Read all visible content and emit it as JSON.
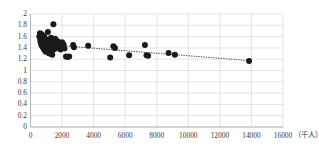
{
  "chart_data": {
    "type": "scatter",
    "title": "",
    "subtitle": "",
    "xlabel": "",
    "ylabel": "",
    "x_unit_label": "（千人）",
    "xlim": [
      0,
      16000
    ],
    "ylim": [
      0,
      2
    ],
    "xticks": [
      0,
      2000,
      4000,
      6000,
      8000,
      10000,
      12000,
      14000,
      16000
    ],
    "xtick_labels": [
      "0",
      "2000",
      "4000",
      "6000",
      "8000",
      "10000",
      "12000",
      "14000",
      "16000"
    ],
    "yticks": [
      0,
      0.2,
      0.4,
      0.6,
      0.8,
      1,
      1.2,
      1.4,
      1.6,
      1.8,
      2
    ],
    "ytick_labels": [
      "0",
      "0.2",
      "0.4",
      "0.6",
      "0.8",
      "1",
      "1.2",
      "1.4",
      "1.6",
      "1.8",
      "2"
    ],
    "grid": true,
    "grid_color": "#d9d9d9",
    "axis_color": "#b0b0b0",
    "legend": false,
    "legend_position": "none",
    "marker_color": "#1a1a1a",
    "marker_size": 3.0,
    "series": [
      {
        "name": "scatter",
        "marker": "circle",
        "points": [
          [
            560,
            1.6
          ],
          [
            600,
            1.66
          ],
          [
            620,
            1.55
          ],
          [
            640,
            1.5
          ],
          [
            650,
            1.62
          ],
          [
            670,
            1.58
          ],
          [
            690,
            1.45
          ],
          [
            700,
            1.53
          ],
          [
            710,
            1.64
          ],
          [
            720,
            1.48
          ],
          [
            740,
            1.57
          ],
          [
            760,
            1.42
          ],
          [
            770,
            1.61
          ],
          [
            790,
            1.51
          ],
          [
            800,
            1.44
          ],
          [
            820,
            1.56
          ],
          [
            840,
            1.38
          ],
          [
            850,
            1.49
          ],
          [
            870,
            1.6
          ],
          [
            880,
            1.41
          ],
          [
            900,
            1.46
          ],
          [
            910,
            1.36
          ],
          [
            930,
            1.52
          ],
          [
            950,
            1.43
          ],
          [
            960,
            1.33
          ],
          [
            980,
            1.47
          ],
          [
            1000,
            1.39
          ],
          [
            1020,
            1.55
          ],
          [
            1040,
            1.42
          ],
          [
            1060,
            1.35
          ],
          [
            1080,
            1.48
          ],
          [
            1100,
            1.68
          ],
          [
            1120,
            1.4
          ],
          [
            1140,
            1.37
          ],
          [
            1160,
            1.44
          ],
          [
            1180,
            1.3
          ],
          [
            1200,
            1.46
          ],
          [
            1220,
            1.54
          ],
          [
            1240,
            1.41
          ],
          [
            1260,
            1.34
          ],
          [
            1280,
            1.43
          ],
          [
            1300,
            1.58
          ],
          [
            1320,
            1.39
          ],
          [
            1350,
            1.47
          ],
          [
            1380,
            1.28
          ],
          [
            1400,
            1.36
          ],
          [
            1420,
            1.51
          ],
          [
            1450,
            1.82
          ],
          [
            1470,
            1.42
          ],
          [
            1500,
            1.45
          ],
          [
            1530,
            1.38
          ],
          [
            1560,
            1.56
          ],
          [
            1600,
            1.4
          ],
          [
            1650,
            1.47
          ],
          [
            1700,
            1.52
          ],
          [
            1750,
            1.43
          ],
          [
            1800,
            1.41
          ],
          [
            1850,
            1.48
          ],
          [
            1900,
            1.37
          ],
          [
            1950,
            1.44
          ],
          [
            2000,
            1.5
          ],
          [
            2050,
            1.42
          ],
          [
            2100,
            1.46
          ],
          [
            2150,
            1.39
          ],
          [
            2250,
            1.25
          ],
          [
            2350,
            1.24
          ],
          [
            2450,
            1.25
          ],
          [
            2700,
            1.45
          ],
          [
            2750,
            1.41
          ],
          [
            3650,
            1.44
          ],
          [
            5050,
            1.23
          ],
          [
            5250,
            1.43
          ],
          [
            5350,
            1.4
          ],
          [
            6250,
            1.27
          ],
          [
            7250,
            1.45
          ],
          [
            7350,
            1.27
          ],
          [
            7450,
            1.26
          ],
          [
            8750,
            1.31
          ],
          [
            9150,
            1.28
          ],
          [
            13850,
            1.17
          ]
        ]
      }
    ],
    "trendline": {
      "style": "dotted",
      "color": "#4d4d4d",
      "x_start": 1500,
      "y_start": 1.45,
      "x_end": 13850,
      "y_end": 1.175
    }
  }
}
